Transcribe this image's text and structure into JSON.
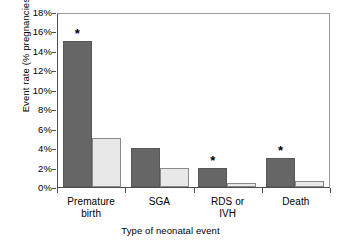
{
  "chart_data": {
    "type": "bar",
    "title": "",
    "xlabel": "Type of neonatal event",
    "ylabel": "Event rate (% pregnancies)",
    "categories": [
      "Premature birth",
      "SGA",
      "RDS or IVH",
      "Death"
    ],
    "category_lines": [
      [
        "Premature",
        "birth"
      ],
      [
        "SGA"
      ],
      [
        "RDS or",
        "IVH"
      ],
      [
        "Death"
      ]
    ],
    "series": [
      {
        "name": "dark",
        "color": "#666666",
        "values": [
          15.0,
          4.0,
          2.0,
          3.0
        ]
      },
      {
        "name": "light",
        "color": "#e8e8e8",
        "values": [
          5.0,
          2.0,
          0.4,
          0.6
        ]
      }
    ],
    "annotations": [
      {
        "category": "Premature birth",
        "series": "dark",
        "text": "*"
      },
      {
        "category": "RDS or IVH",
        "series": "dark",
        "text": "*"
      },
      {
        "category": "Death",
        "series": "dark",
        "text": "*"
      }
    ],
    "ylim": [
      0,
      18
    ],
    "yticks": [
      0,
      2,
      4,
      6,
      8,
      10,
      12,
      14,
      16,
      18
    ],
    "ytick_labels": [
      "0%",
      "2%",
      "4%",
      "6%",
      "8%",
      "10%",
      "12%",
      "14%",
      "16%",
      "18%"
    ],
    "grid": false,
    "legend": "none"
  },
  "axis": {
    "y_title": "Event rate (% pregnancies)",
    "x_title": "Type of neonatal event"
  }
}
